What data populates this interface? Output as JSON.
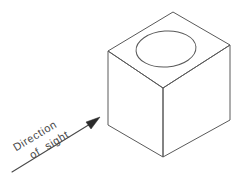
{
  "figure": {
    "background_color": "#ffffff",
    "line_color": "#5a5a5a",
    "annotation": {
      "line_1": "Direction",
      "line_2": "of  sight",
      "arrow_name": "direction-of-sight-arrow",
      "arrow_color": "#2a2a2a",
      "text_color": "#4a4a4a",
      "rotation_degrees": -31,
      "start_point": "12,172",
      "tip_point": "99,118"
    },
    "solid": {
      "name": "cube",
      "shape": "cube",
      "faces": [
        {
          "name": "top-face",
          "points": "173,12 230,45 163,88 108,51"
        },
        {
          "name": "left-face",
          "points": "108,51 163,88 163,157 108,125"
        },
        {
          "name": "right-face",
          "points": "163,88 230,45 230,120 163,157"
        }
      ],
      "vertices": {
        "top_apex": "173,12",
        "top_right": "230,45",
        "top_front": "163,88",
        "top_left": "108,51",
        "bottom_left": "108,125",
        "bottom_front": "163,157",
        "bottom_right": "230,120"
      }
    },
    "hole": {
      "name": "circular-hole",
      "shape": "ellipse",
      "center_x": 166,
      "center_y": 49,
      "radius_x": 30,
      "radius_y": 18,
      "tilt_degrees": -4
    }
  }
}
